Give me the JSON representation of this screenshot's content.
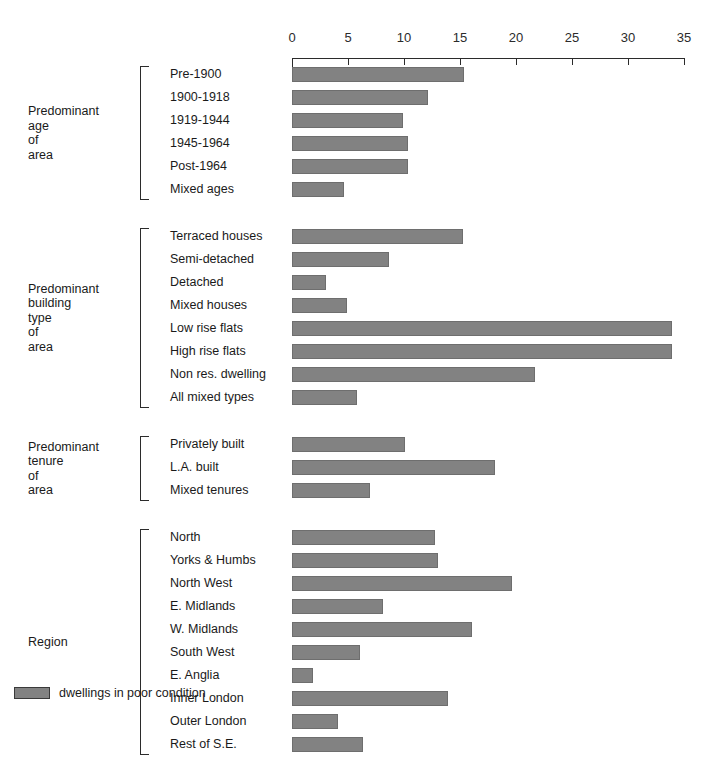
{
  "chart_data": {
    "type": "bar",
    "orientation": "horizontal",
    "title": "",
    "xlabel": "",
    "ylabel": "",
    "xlim": [
      0,
      35
    ],
    "xticks": [
      0,
      5,
      10,
      15,
      20,
      25,
      30,
      35
    ],
    "tick_labels": [
      "0",
      "5",
      "10",
      "15",
      "20",
      "25",
      "30",
      "35"
    ],
    "grid": false,
    "legend_position": "bottom-left",
    "bar_color": "#828282",
    "axis_color": "#2b2b2b",
    "legend": [
      {
        "swatch": "#828282",
        "label": "dwellings in poor condition"
      }
    ],
    "groups": [
      {
        "title": "Predominant\nage\nof\narea",
        "categories": [
          "Pre-1900",
          "1900-1918",
          "1919-1944",
          "1945-1964",
          "Post-1964",
          "Mixed ages"
        ],
        "values": [
          15.4,
          12.1,
          9.9,
          10.4,
          10.4,
          4.6
        ]
      },
      {
        "title": "Predominant\nbuilding\ntype\nof\narea",
        "categories": [
          "Terraced houses",
          "Semi-detached",
          "Detached",
          "Mixed houses",
          "Low rise flats",
          "High rise flats",
          "Non res. dwelling",
          "All mixed types"
        ],
        "values": [
          15.3,
          8.7,
          3.0,
          4.9,
          33.9,
          33.9,
          21.7,
          5.8
        ]
      },
      {
        "title": "Predominant\ntenure\nof\narea",
        "categories": [
          "Privately built",
          "L.A. built",
          "Mixed tenures"
        ],
        "values": [
          10.1,
          18.1,
          7.0
        ]
      },
      {
        "title": "Region",
        "categories": [
          "North",
          "Yorks & Humbs",
          "North West",
          "E. Midlands",
          "W. Midlands",
          "South West",
          "E. Anglia",
          "Inner London",
          "Outer London",
          "Rest of S.E."
        ],
        "values": [
          12.8,
          13.0,
          19.6,
          8.1,
          16.1,
          6.1,
          1.9,
          13.9,
          4.1,
          6.3
        ]
      }
    ]
  }
}
